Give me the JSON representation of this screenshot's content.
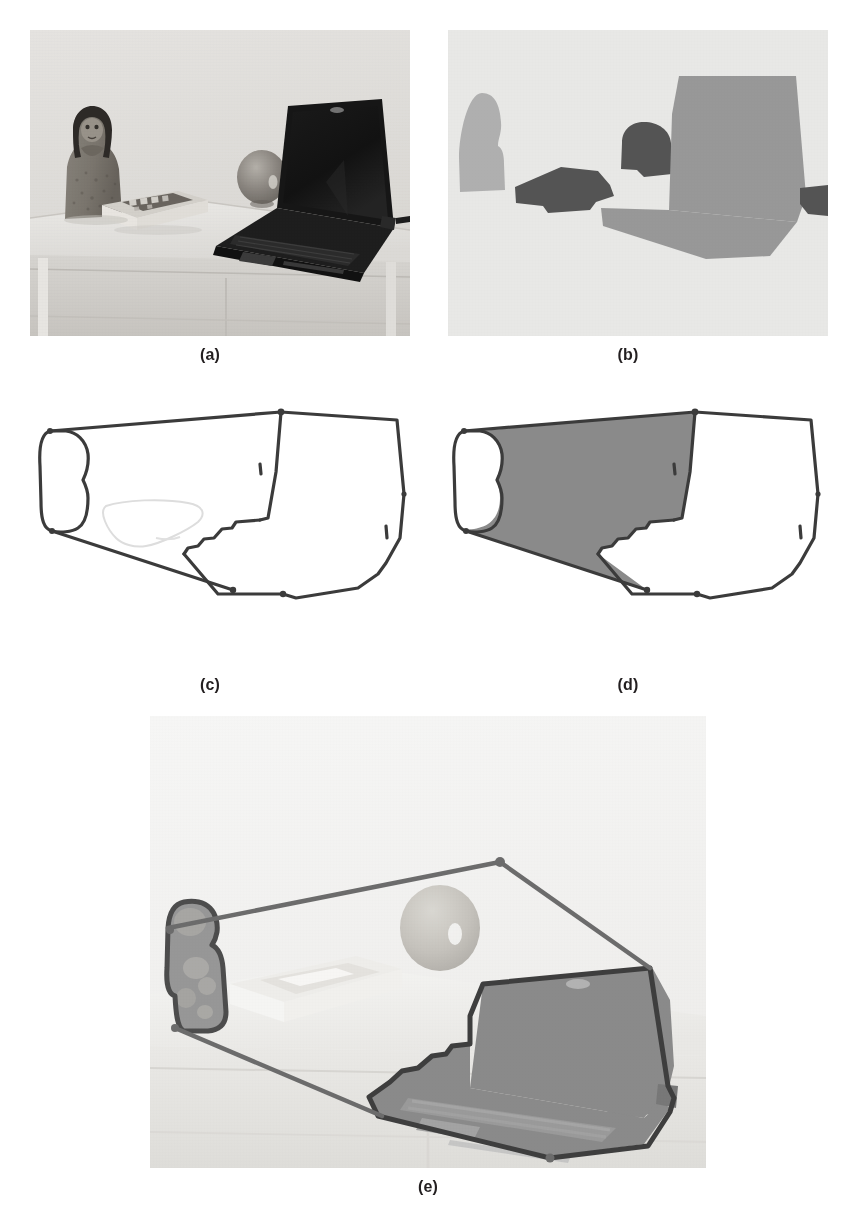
{
  "figure": {
    "panel_count": 5,
    "background_color": "#ffffff",
    "label_color": "#231f20",
    "panels": [
      {
        "id": "a",
        "label": "(a)",
        "caption_label": "(a)",
        "content_type": "photograph",
        "description": "Grayscale photograph of a desk scene: a small stone figurine, a hardcover book, a round glass ball, and an open laptop computer on a white table.",
        "objects": [
          "figurine",
          "book",
          "glass-ball",
          "laptop",
          "table"
        ],
        "background_color": "#e9e9e7",
        "dominant_colors": [
          "#eceae6",
          "#8f8a84",
          "#1c1c1c"
        ]
      },
      {
        "id": "b",
        "label": "(b)",
        "caption_label": "(b)",
        "content_type": "segmentation-mask",
        "description": "Segmentation / saliency map showing gray blobs on a near-white background corresponding to the figurine, book, glass ball and laptop.",
        "background_color": "#ececea",
        "region_colors": {
          "light_gray": "#b0b0b0",
          "mid_gray": "#9a9a9a",
          "dark_gray": "#5a5a5a"
        },
        "regions": [
          "figurine-blob",
          "book-blob",
          "ball-blob",
          "laptop-screen-blob",
          "laptop-base-blob",
          "cable-blob"
        ]
      },
      {
        "id": "c",
        "label": "(c)",
        "caption_label": "(c)",
        "content_type": "contour-outline",
        "description": "Extracted object contours drawn as dark outlines on a white background; a faint light outline marks the book.",
        "background_color": "#ffffff",
        "stroke_color": "#3a3a3a",
        "faint_stroke_color": "#dedede",
        "stroke_width": 3
      },
      {
        "id": "d",
        "label": "(d)",
        "caption_label": "(d)",
        "content_type": "filled-region",
        "description": "Same contour as (c) with the enclosed background region filled in mid gray, leaving the figurine interior and laptop region white.",
        "background_color": "#ffffff",
        "fill_color": "#8a8a8a",
        "stroke_color": "#3a3a3a",
        "stroke_width": 3
      },
      {
        "id": "e",
        "label": "(e)",
        "caption_label": "(e)",
        "content_type": "overlay",
        "description": "Contour result overlaid on the washed-out original photograph; the figurine and the laptop are shaded and outlined, the remaining scene is faded.",
        "background_color": "#f6f6f4",
        "stroke_color": "#4a4a4a",
        "shade_color": "#8e8e8e",
        "stroke_width": 4
      }
    ]
  }
}
